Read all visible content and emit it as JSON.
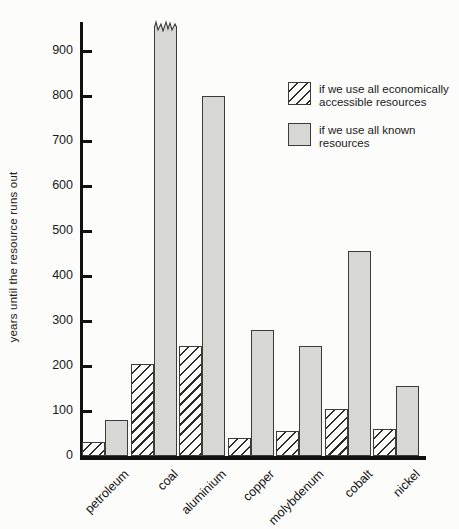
{
  "figure": {
    "background": "#fcfcfa"
  },
  "chart_data": {
    "type": "bar",
    "title": "",
    "xlabel": "",
    "ylabel": "years until the resource runs out",
    "categories": [
      "petroleum",
      "coal",
      "aluminium",
      "copper",
      "molybdenum",
      "cobalt",
      "nickel"
    ],
    "series": [
      {
        "name": "if we use all economically accessible resources",
        "style": "hatched",
        "values": [
          30,
          205,
          245,
          40,
          55,
          105,
          60
        ]
      },
      {
        "name": "if we use all known resources",
        "style": "solid-gray",
        "values": [
          80,
          970,
          800,
          280,
          245,
          455,
          155
        ]
      }
    ],
    "truncated_bars": [
      {
        "category": "coal",
        "series": "if we use all known resources",
        "note": "bar exceeds top of axis; drawn with torn jagged top edge"
      }
    ],
    "ylim": [
      0,
      965
    ],
    "yticks": [
      0,
      100,
      200,
      300,
      400,
      500,
      600,
      700,
      800,
      900
    ],
    "grid": false,
    "legend_position": "upper-right",
    "colors": {
      "known_bar_fill": "#d7d7d4",
      "hatched_bar_fill": "#fcfcfa",
      "hatch_lines": "#2b2b2b",
      "bar_outline": "#3c3c3c",
      "axis": "#111111"
    }
  }
}
